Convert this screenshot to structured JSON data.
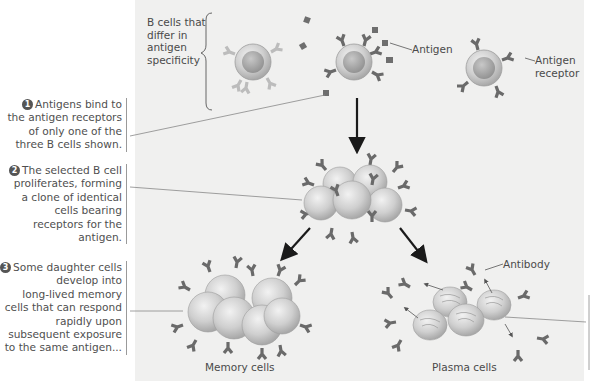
{
  "diagram": {
    "bracket_label": "B cells that differ in antigen specificity",
    "bracket_lines": [
      "B cells that",
      "differ in",
      "antigen",
      "specificity"
    ],
    "labels": {
      "antigen": "Antigen",
      "antigen_receptor_line1": "Antigen",
      "antigen_receptor_line2": "receptor",
      "antibody": "Antibody",
      "memory_cells": "Memory cells",
      "plasma_cells": "Plasma cells"
    },
    "steps": [
      {
        "number": "1",
        "lines": [
          "Antigens bind to",
          "the antigen receptors",
          "of only one of the",
          "three B cells shown."
        ]
      },
      {
        "number": "2",
        "lines": [
          "The selected B cell",
          "proliferates, forming",
          "a clone of identical",
          "cells bearing",
          "receptors for the",
          "antigen."
        ]
      },
      {
        "number": "3",
        "lines": [
          "Some daughter cells",
          "develop into",
          "long-lived memory",
          "cells that can respond",
          "rapidly upon",
          "subsequent exposure",
          "to the same antigen..."
        ]
      }
    ],
    "colors": {
      "panel": "#f0f0ef",
      "cell_fill": "#c9c9c9",
      "cell_nucleus": "#a9a9a9",
      "receptor": "#6a6a6a",
      "pale_receptor": "#bdbdbd",
      "arrow": "#1a1a1a"
    }
  }
}
